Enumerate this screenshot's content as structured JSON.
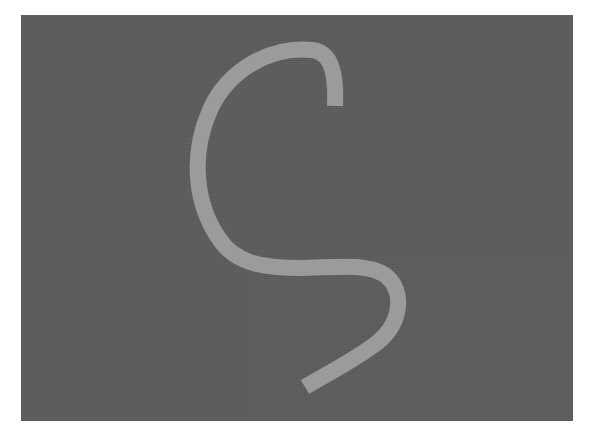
{
  "image": {
    "background_color": "#ffffff",
    "canvas": {
      "color": "#5e5e5e",
      "x": 21,
      "y": 15,
      "width": 552,
      "height": 406
    },
    "stroke": {
      "color": "#9b9b9b",
      "width": 16,
      "shape": "hand-drawn S-like curve",
      "path": "M335 106 C336 80 334 52 312 50 C270 46 228 70 210 110 C190 155 195 205 220 240 C235 262 260 268 300 268 C330 268 365 262 385 275 C405 290 402 322 378 342 C355 360 330 372 305 387"
    }
  }
}
